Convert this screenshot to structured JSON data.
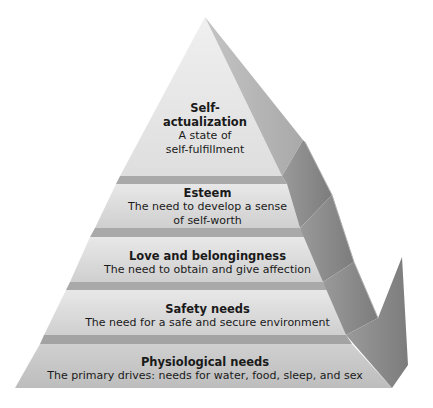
{
  "diagram": {
    "type": "pyramid",
    "levels": [
      {
        "title": "Self-actualization",
        "title_line1": "Self-",
        "title_line2": "actualization",
        "description": "A state of self-fulfillment",
        "description_line1": "A state of",
        "description_line2": "self-fulfillment"
      },
      {
        "title": "Esteem",
        "description": "The need to develop a sense of self-worth",
        "description_line1": "The need to develop a sense",
        "description_line2": "of self-worth"
      },
      {
        "title": "Love and belongingness",
        "description": "The need to obtain and give affection"
      },
      {
        "title": "Safety needs",
        "description": "The need for a safe and secure environment"
      },
      {
        "title": "Physiological needs",
        "description": "The primary drives: needs for water, food, sleep, and sex"
      }
    ],
    "colors": {
      "front_face_light": "#e6e6e6",
      "front_face_dark": "#c4c4c4",
      "band": "#a8a8a8",
      "side_face": "#8f8f8f",
      "side_face_light": "#b5b5b5",
      "text": "#1a1a1a"
    }
  }
}
